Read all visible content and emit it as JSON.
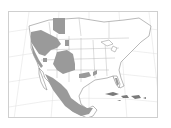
{
  "map": {
    "type": "species-range-map",
    "region": "North America",
    "colors": {
      "background": "#ffffff",
      "range_fill": "#9a9a9a",
      "land_outline": "#8a8a8a",
      "graticule": "#dcdcdc",
      "borders": "#a0a0a0",
      "frame": "#cfcfcf"
    }
  }
}
